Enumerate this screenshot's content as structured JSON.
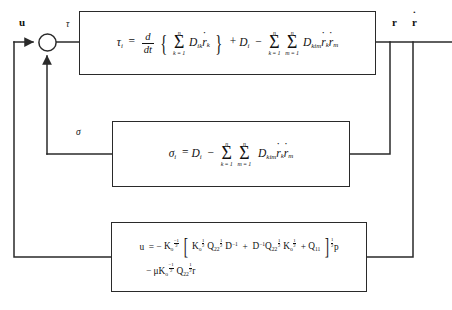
{
  "diagram": {
    "type": "control-block-diagram",
    "canvas": {
      "width": 452,
      "height": 310
    },
    "colors": {
      "line": "#2a2a2a",
      "text": "#111111",
      "background": "#ffffff"
    }
  },
  "signals": [
    {
      "id": "u",
      "label": "u",
      "style": "bold-roman",
      "x": 22,
      "y": 22
    },
    {
      "id": "tau",
      "label": "τ",
      "style": "italic-greek",
      "x": 66,
      "y": 24
    },
    {
      "id": "sigma",
      "label": "σ",
      "style": "italic-greek",
      "x": 76,
      "y": 131
    },
    {
      "id": "r",
      "label": "r",
      "style": "bold-roman",
      "x": 392,
      "y": 22
    },
    {
      "id": "rdot",
      "label": "r",
      "style": "bold-roman-dot",
      "x": 414,
      "y": 22
    }
  ],
  "summing_junction": {
    "name": "summing-junction",
    "cx": 47,
    "cy": 42,
    "r": 9,
    "inputs": [
      "u",
      "sigma"
    ],
    "output": "tau"
  },
  "blocks": [
    {
      "id": "block-dynamics",
      "name": "torque-dynamics-block",
      "x": 79,
      "y": 11,
      "width": 297,
      "height": 64,
      "input_signal": "τ",
      "output_signal": "r",
      "equation_plain": "τ_i = d/dt [ Σ(k=1..n) D_ik ṙ_k ] + D_i − Σ(k=1..n) Σ(m=1..n) D_kim ṙ_k ṙ_m",
      "equation_label": "joint torque equation"
    },
    {
      "id": "block-sigma",
      "name": "sigma-feedback-block",
      "x": 112,
      "y": 121,
      "width": 238,
      "height": 66,
      "input_signal": "r",
      "output_signal": "σ",
      "equation_plain": "σ_i = D_i − Σ(k=1..n) Σ(m=1..n) D_kim ṙ_k ṙ_m",
      "equation_label": "nonlinear compensation term"
    },
    {
      "id": "block-control",
      "name": "control-law-block",
      "x": 111,
      "y": 222,
      "width": 256,
      "height": 70,
      "input_signal": "r",
      "output_signal": "u",
      "equation_plain_line1": "u = − K_0^(−1/2) [ K_0^(1/2) Q_22^(1/2) D^(−1) + D^(−1) Q_22^(1/2) K_0^(1/2) + Q_11 ]^(1/2) p",
      "equation_plain_line2": "− μ K_0^(−1/2) Q_22^(1/2) r",
      "equation_label": "optimal control law"
    }
  ],
  "wires": [
    {
      "name": "wire-u-input",
      "path": "u enters summing junction from left"
    },
    {
      "name": "wire-sigma-feedback",
      "path": "sigma enters summing junction from below"
    },
    {
      "name": "wire-tau-to-block1",
      "path": "summing junction to dynamics block"
    },
    {
      "name": "wire-output-bus",
      "path": "dynamics block output r, r-dot to right rail"
    },
    {
      "name": "wire-branch-sigma",
      "path": "output branch down into sigma block right side"
    },
    {
      "name": "wire-branch-control",
      "path": "output branch down into control block right side"
    },
    {
      "name": "wire-u-return",
      "path": "control block output u left and up to summing junction"
    }
  ]
}
